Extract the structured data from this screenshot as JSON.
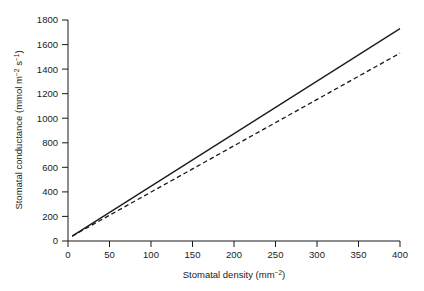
{
  "chart_data": {
    "type": "line",
    "title": "",
    "xlabel": "Stomatal density (mm−2)",
    "ylabel": "Stomatal conductance (mmol m−2 s−1)",
    "xlabel_parts": {
      "text": "Stomatal density (mm",
      "sup": "−2",
      "tail": ")"
    },
    "ylabel_parts": {
      "text": "Stomatal conductance (mmol m",
      "sup1": "−2",
      "mid": " s",
      "sup2": "−1",
      "tail": ")"
    },
    "xlim": [
      0,
      400
    ],
    "ylim": [
      0,
      1800
    ],
    "xticks": [
      0,
      50,
      100,
      150,
      200,
      250,
      300,
      350,
      400
    ],
    "yticks": [
      0,
      200,
      400,
      600,
      800,
      1000,
      1200,
      1400,
      1600,
      1800
    ],
    "grid": false,
    "legend": "none",
    "series": [
      {
        "name": "solid-line",
        "style": "solid",
        "color": "#1a1a1a",
        "x": [
          5,
          400
        ],
        "values": [
          40,
          1730
        ]
      },
      {
        "name": "dashed-line",
        "style": "dashed",
        "color": "#1a1a1a",
        "x": [
          5,
          400
        ],
        "values": [
          40,
          1530
        ]
      }
    ]
  },
  "axis": {
    "x_tick_labels": [
      "0",
      "50",
      "100",
      "150",
      "200",
      "250",
      "300",
      "350",
      "400"
    ],
    "y_tick_labels": [
      "0",
      "200",
      "400",
      "600",
      "800",
      "1000",
      "1200",
      "1400",
      "1600",
      "1800"
    ]
  }
}
